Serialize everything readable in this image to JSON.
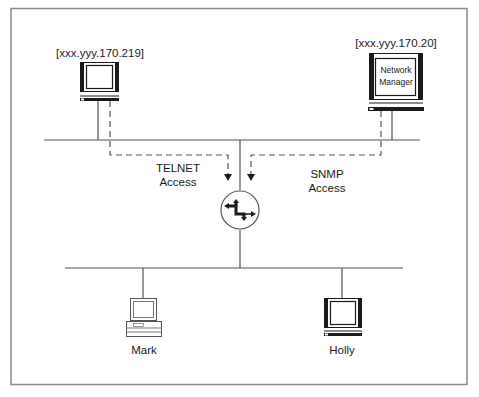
{
  "diagram": {
    "type": "network-topology",
    "nodes": {
      "telnet_host": {
        "address": "[xxx.yyy.170.219]",
        "icon": "monitor-icon"
      },
      "network_manager": {
        "address": "[xxx.yyy.170.20]",
        "screen_line1": "Network",
        "screen_line2": "Manager",
        "icon": "monitor-icon"
      },
      "router": {
        "icon": "router-icon"
      },
      "mark": {
        "label": "Mark",
        "icon": "desktop-computer-icon"
      },
      "holly": {
        "label": "Holly",
        "icon": "monitor-icon"
      }
    },
    "access_paths": {
      "telnet": {
        "line1": "TELNET",
        "line2": "Access",
        "style": "dashed"
      },
      "snmp": {
        "line1": "SNMP",
        "line2": "Access",
        "style": "dashed"
      }
    },
    "colors": {
      "line": "#555555",
      "frame": "#888888",
      "icon_dark": "#1a1a1a",
      "background": "#ffffff"
    }
  }
}
